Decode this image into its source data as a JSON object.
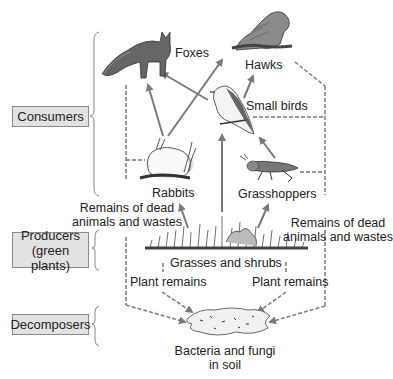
{
  "categories": {
    "consumers": "Consumers",
    "producers_line1": "Producers",
    "producers_line2": "(green plants)",
    "decomposers": "Decomposers"
  },
  "organisms": {
    "foxes": "Foxes",
    "hawks": "Hawks",
    "small_birds": "Small birds",
    "rabbits": "Rabbits",
    "grasshoppers": "Grasshoppers",
    "grasses": "Grasses and shrubs",
    "bacteria_line1": "Bacteria and fungi",
    "bacteria_line2": "in soil"
  },
  "flow_labels": {
    "remains_left_line1": "Remains of dead",
    "remains_left_line2": "animals and wastes",
    "remains_right_line1": "Remains of dead",
    "remains_right_line2": "animals and wastes",
    "plant_remains_left": "Plant remains",
    "plant_remains_right": "Plant remains"
  },
  "colors": {
    "arrow": "#7a7a7a",
    "box_fill": "#e2e2e2",
    "box_border": "#8a8a8a",
    "text": "#222222"
  }
}
